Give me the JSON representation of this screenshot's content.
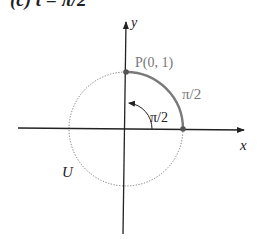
{
  "title": "(c) t = π/2",
  "axes": {
    "x_label": "x",
    "y_label": "y"
  },
  "circle": {
    "label": "U",
    "style": "dotted",
    "color": "#777777"
  },
  "point": {
    "label": "P(0, 1)",
    "color": "#555555"
  },
  "arc": {
    "label": "π/2",
    "color": "#7a7a7a"
  },
  "angle": {
    "label": "π/2"
  },
  "colors": {
    "axis": "#222222",
    "arc": "#7a7a7a",
    "text_gray": "#777777",
    "text_dark": "#222222"
  }
}
